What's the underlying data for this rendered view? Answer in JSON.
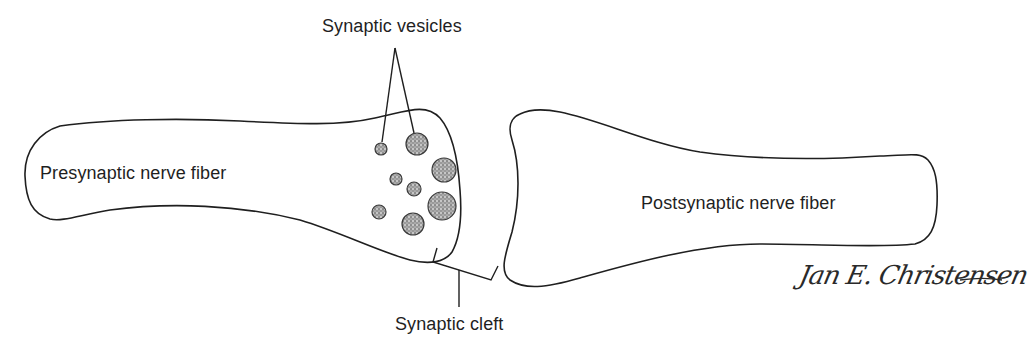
{
  "diagram": {
    "type": "anatomical illustration",
    "labels": {
      "vesicles": "Synaptic vesicles",
      "presynaptic": "Presynaptic nerve fiber",
      "postsynaptic": "Postsynaptic nerve fiber",
      "cleft": "Synaptic cleft"
    },
    "signature": "Jan E. Christensen",
    "colors": {
      "outline": "#1f1f1f",
      "vesicle_fill": "#8a8a8a",
      "background": "#ffffff"
    },
    "vesicles": [
      {
        "cx": 381,
        "cy": 149,
        "r": 6
      },
      {
        "cx": 417,
        "cy": 144,
        "r": 11
      },
      {
        "cx": 444,
        "cy": 170,
        "r": 12
      },
      {
        "cx": 396,
        "cy": 179,
        "r": 6
      },
      {
        "cx": 414,
        "cy": 189,
        "r": 7
      },
      {
        "cx": 442,
        "cy": 206,
        "r": 14
      },
      {
        "cx": 379,
        "cy": 212,
        "r": 7
      },
      {
        "cx": 413,
        "cy": 224,
        "r": 11
      }
    ]
  }
}
